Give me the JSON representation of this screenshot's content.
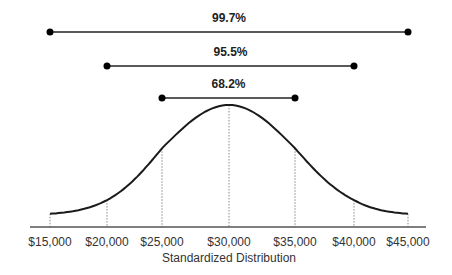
{
  "chart_data": {
    "type": "line",
    "title": "",
    "xlabel": "Standardized Distribution",
    "ylabel": "",
    "mean": 30000,
    "std_dev": 5000,
    "x_ticks": [
      "$15,000",
      "$20,000",
      "$25,000",
      "$30,000",
      "$35,000",
      "$40,000",
      "$45,000"
    ],
    "x_values": [
      15000,
      20000,
      25000,
      30000,
      35000,
      40000,
      45000
    ],
    "grid": false,
    "legend": null,
    "intervals": [
      {
        "label": "99.7%",
        "from": 15000,
        "to": 45000
      },
      {
        "label": "95.5%",
        "from": 20000,
        "to": 40000
      },
      {
        "label": "68.2%",
        "from": 25000,
        "to": 35000
      }
    ]
  }
}
